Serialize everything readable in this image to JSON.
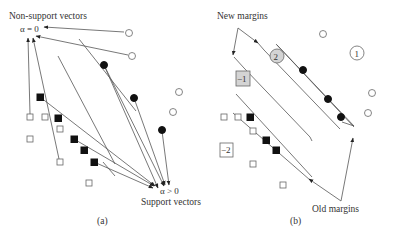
{
  "panel_a": {
    "caption": "(a)",
    "top_label": "Non-support vectors",
    "top_alpha": "α = 0",
    "bottom_alpha": "α > 0",
    "bottom_label": "Support vectors"
  },
  "panel_b": {
    "caption": "(b)",
    "top_label": "New margins",
    "bottom_label": "Old margins",
    "circle_label_1": "1",
    "circle_label_2": "2",
    "square_label_neg1": "−1",
    "square_label_neg2": "−2"
  },
  "colors": {
    "line": "#555555",
    "filled_marker": "#111111",
    "open_marker_stroke": "#666666",
    "highlight_gray": "#d4d4d4"
  }
}
